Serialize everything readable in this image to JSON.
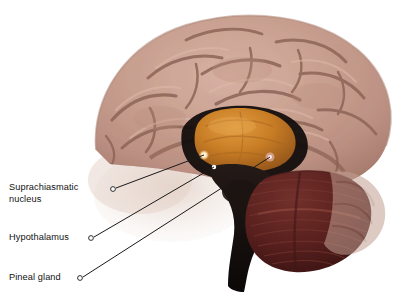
{
  "figure": {
    "type": "anatomical-illustration",
    "background_color": "#ffffff",
    "regions": [
      {
        "name": "cerebral-cortex",
        "color": "#c49a8c",
        "description": "pink-tan gyri and sulci"
      },
      {
        "name": "corpus-callosum-thalamus",
        "color": "#c97a28",
        "description": "orange central mass"
      },
      {
        "name": "cerebellum",
        "color": "#5d2320",
        "description": "dark maroon striated"
      },
      {
        "name": "brainstem",
        "color": "#120d0c",
        "description": "near-black descending column"
      }
    ]
  },
  "labels": [
    {
      "id": "suprachiasmatic-nucleus",
      "text": "Suprachiasmatic\nnucleus",
      "line_one": "Suprachiasmatic",
      "line_two": "nucleus",
      "marker_color": "#ffe9c4",
      "leader_start": {
        "x": 116,
        "y": 188
      },
      "leader_end": {
        "x": 204,
        "y": 155
      }
    },
    {
      "id": "hypothalamus",
      "text": "Hypothalamus",
      "line_one": "Hypothalamus",
      "line_two": "",
      "marker_color": "#ffffff",
      "leader_start": {
        "x": 94,
        "y": 237
      },
      "leader_end": {
        "x": 214,
        "y": 167
      }
    },
    {
      "id": "pineal-gland",
      "text": "Pineal gland",
      "line_one": "Pineal gland",
      "line_two": "",
      "marker_color": "#f3c9d6",
      "leader_start": {
        "x": 83,
        "y": 277
      },
      "leader_end": {
        "x": 270,
        "y": 157
      }
    }
  ],
  "style": {
    "leader_line_color": "#1a1a1a",
    "text_color": "#111111"
  }
}
